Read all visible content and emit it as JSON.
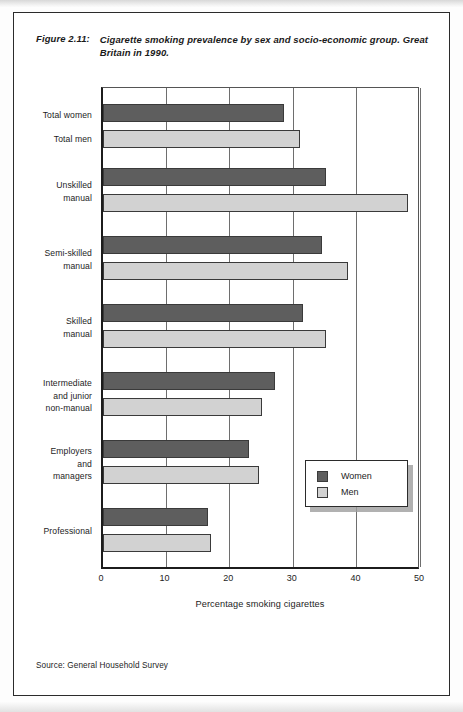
{
  "figure": {
    "label": "Figure 2.11:",
    "title": "Cigarette smoking prevalence by sex and socio-economic group.\nGreat Britain in 1990.",
    "source_note": "Source: General Household Survey"
  },
  "legend": {
    "position": "inside-right-lower",
    "items": [
      {
        "name": "Women",
        "color": "#5e5e5e"
      },
      {
        "name": "Men",
        "color": "#d2d2d2"
      }
    ]
  },
  "axis": {
    "x_title": "Percentage smoking cigarettes",
    "x_ticks": [
      "0",
      "10",
      "20",
      "30",
      "40",
      "50"
    ]
  },
  "chart_data": {
    "type": "bar",
    "orientation": "horizontal",
    "title": "Cigarette smoking prevalence by sex and socio-economic group. Great Britain in 1990.",
    "xlabel": "Percentage smoking cigarettes",
    "ylabel": "",
    "xlim": [
      0,
      50
    ],
    "xticks": [
      0,
      10,
      20,
      30,
      40,
      50
    ],
    "grid": true,
    "grid_axis": "x",
    "legend_position": "inside lower right",
    "categories": [
      "Total women / Total men",
      "Unskilled manual",
      "Semi-skilled manual",
      "Skilled manual",
      "Intermediate and junior non-manual",
      "Employers and managers",
      "Professional"
    ],
    "category_labels": [
      [
        "Total women",
        "Total men"
      ],
      [
        "Unskilled",
        "manual"
      ],
      [
        "Semi-skilled",
        "manual"
      ],
      [
        "Skilled",
        "manual"
      ],
      [
        "Intermediate",
        "and junior",
        "non-manual"
      ],
      [
        "Employers",
        "and",
        "managers"
      ],
      [
        "Professional"
      ]
    ],
    "series": [
      {
        "name": "Women",
        "color": "#5e5e5e",
        "values": [
          28.5,
          35,
          34.5,
          31.5,
          27,
          23,
          16.5
        ]
      },
      {
        "name": "Men",
        "color": "#d2d2d2",
        "values": [
          31,
          48,
          38.5,
          35,
          25,
          24.5,
          17
        ]
      }
    ],
    "units": "percent",
    "source": "General Household Survey"
  },
  "rows": [
    {
      "label": "Total women",
      "label2": "Total men",
      "women": 28.5,
      "men": 31,
      "top": 16,
      "label_top": 22,
      "label2_top": 46
    },
    {
      "label": "Unskilled\nmanual",
      "women": 35,
      "men": 48,
      "top": 80,
      "label_top": 92
    },
    {
      "label": "Semi-skilled\nmanual",
      "women": 34.5,
      "men": 38.5,
      "top": 148,
      "label_top": 160
    },
    {
      "label": "Skilled\nmanual",
      "women": 31.5,
      "men": 35,
      "top": 216,
      "label_top": 228
    },
    {
      "label": "Intermediate\nand junior\nnon-manual",
      "women": 27,
      "men": 25,
      "top": 284,
      "label_top": 290
    },
    {
      "label": "Employers\nand\nmanagers",
      "women": 23,
      "men": 24.5,
      "top": 352,
      "label_top": 358
    },
    {
      "label": "Professional",
      "women": 16.5,
      "men": 17,
      "top": 420,
      "label_top": 438
    }
  ]
}
